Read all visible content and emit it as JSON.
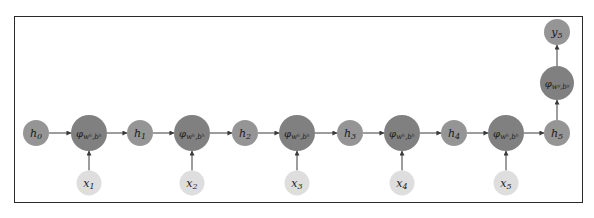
{
  "diagram": {
    "type": "rnn-unrolled",
    "colors": {
      "hidden_node": "#959595",
      "phi_node": "#808080",
      "input_node": "#dedede",
      "output_node": "#959595",
      "edge": "#3a3a3a",
      "frame": "#2a2a2a"
    },
    "hidden": [
      {
        "id": "h0",
        "label": "h",
        "sub": "0"
      },
      {
        "id": "h1",
        "label": "h",
        "sub": "1"
      },
      {
        "id": "h2",
        "label": "h",
        "sub": "2"
      },
      {
        "id": "h3",
        "label": "h",
        "sub": "3"
      },
      {
        "id": "h4",
        "label": "h",
        "sub": "4"
      },
      {
        "id": "h5",
        "label": "h",
        "sub": "5"
      }
    ],
    "phi": [
      {
        "id": "phi1",
        "label": "φ",
        "sub": "wʰ,bʰ"
      },
      {
        "id": "phi2",
        "label": "φ",
        "sub": "wʰ,bʰ"
      },
      {
        "id": "phi3",
        "label": "φ",
        "sub": "wʰ,bʰ"
      },
      {
        "id": "phi4",
        "label": "φ",
        "sub": "wʰ,bʰ"
      },
      {
        "id": "phi5",
        "label": "φ",
        "sub": "wʰ,bʰ"
      }
    ],
    "inputs": [
      {
        "id": "x1",
        "label": "x",
        "sub": "1"
      },
      {
        "id": "x2",
        "label": "x",
        "sub": "2"
      },
      {
        "id": "x3",
        "label": "x",
        "sub": "3"
      },
      {
        "id": "x4",
        "label": "x",
        "sub": "4"
      },
      {
        "id": "x5",
        "label": "x",
        "sub": "5"
      }
    ],
    "output_phi": {
      "id": "phiy",
      "label": "φ",
      "sub": "wʸ,bʸ"
    },
    "output": {
      "id": "y5",
      "label": "y",
      "sub": "5"
    }
  }
}
